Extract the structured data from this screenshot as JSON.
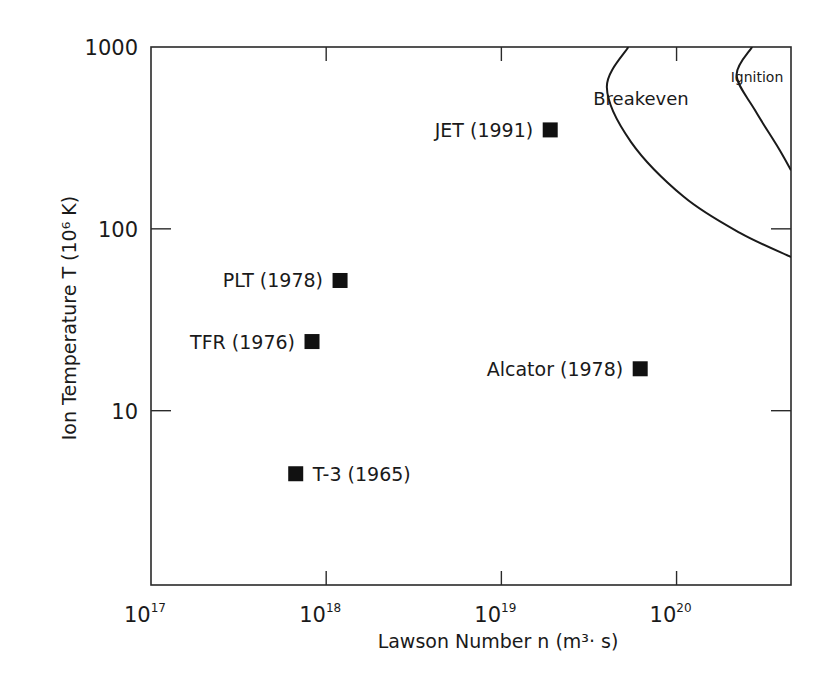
{
  "chart_data": {
    "type": "scatter",
    "title": "",
    "xlabel": "Lawson Number n  (m³· s)",
    "ylabel": "Ion Temperature T (10⁶ K)",
    "xscale": "log",
    "yscale": "log",
    "xlim": [
      1e+17,
      4.5e+20
    ],
    "ylim": [
      1.1,
      1000
    ],
    "x_ticks": [
      {
        "value": 1e+17,
        "base": "10",
        "exp": "17"
      },
      {
        "value": 1e+18,
        "base": "10",
        "exp": "18"
      },
      {
        "value": 1e+19,
        "base": "10",
        "exp": "19"
      },
      {
        "value": 1e+20,
        "base": "10",
        "exp": "20"
      }
    ],
    "y_ticks": [
      {
        "value": 1000,
        "label": "1000"
      },
      {
        "value": 100,
        "label": "100"
      },
      {
        "value": 10,
        "label": "10"
      }
    ],
    "grid": false,
    "legend": null,
    "points": [
      {
        "label": "JET (1991)",
        "x": 1.9e+19,
        "y": 350,
        "label_side": "left"
      },
      {
        "label": "PLT (1978)",
        "x": 1.2e+18,
        "y": 52,
        "label_side": "left"
      },
      {
        "label": "TFR (1976)",
        "x": 8.3e+17,
        "y": 24,
        "label_side": "left"
      },
      {
        "label": "Alcator (1978)",
        "x": 6.2e+19,
        "y": 17,
        "label_side": "left"
      },
      {
        "label": "T-3 (1965)",
        "x": 6.7e+17,
        "y": 4.5,
        "label_side": "right"
      }
    ],
    "curves": [
      {
        "name": "Breakeven",
        "points": [
          [
            5.3e+19,
            1000
          ],
          [
            4e+19,
            600
          ],
          [
            5.5e+19,
            300
          ],
          [
            1.1e+20,
            150
          ],
          [
            2.3e+20,
            95
          ],
          [
            4.5e+20,
            70
          ]
        ]
      },
      {
        "name": "Ignition",
        "points": [
          [
            2.7e+20,
            1000
          ],
          [
            2.2e+20,
            700
          ],
          [
            2.8e+20,
            450
          ],
          [
            3.8e+20,
            280
          ],
          [
            4.5e+20,
            210
          ]
        ]
      }
    ],
    "annotations": [
      "Breakeven",
      "Ignition"
    ]
  },
  "labels": {
    "breakeven": "Breakeven",
    "ignition": "Ignition"
  }
}
